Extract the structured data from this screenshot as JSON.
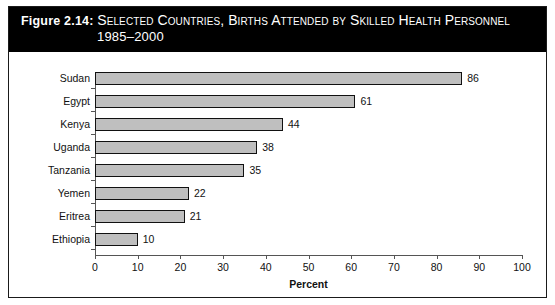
{
  "figure": {
    "number_label": "Figure 2.14:",
    "title_line_1": "Selected Countries, Births Attended by Skilled Health Personnel",
    "title_line_2": "1985–2000"
  },
  "chart_data": {
    "type": "bar",
    "orientation": "horizontal",
    "title": "Figure 2.14: Selected Countries, Births Attended by Skilled Health Personnel 1985–2000",
    "categories": [
      "Sudan",
      "Egypt",
      "Kenya",
      "Uganda",
      "Tanzania",
      "Yemen",
      "Eritrea",
      "Ethiopia"
    ],
    "values": [
      86,
      61,
      44,
      38,
      35,
      22,
      21,
      10
    ],
    "xlabel": "Percent",
    "ylabel": "",
    "xlim": [
      0,
      100
    ],
    "xticks": [
      0,
      10,
      20,
      30,
      40,
      50,
      60,
      70,
      80,
      90,
      100
    ],
    "grid": false,
    "legend": false,
    "bar_fill": "#bfbfbf",
    "bar_border": "#111111",
    "data_labels": [
      "86",
      "61",
      "44",
      "38",
      "35",
      "22",
      "21",
      "10"
    ]
  },
  "style": {
    "band_background": "#000000",
    "band_text": "#ffffff",
    "page_background": "#ffffff",
    "frame_color": "#1a1a1a"
  }
}
